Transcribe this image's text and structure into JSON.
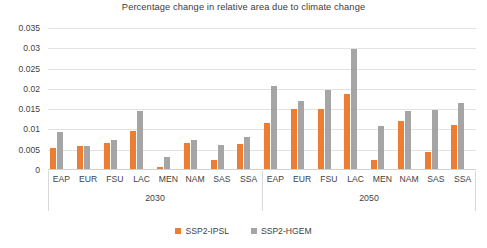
{
  "chart_data": {
    "type": "bar",
    "title": "Percentage change in relative area due to climate change",
    "xlabel": "",
    "ylabel": "",
    "ylim": [
      0,
      0.035
    ],
    "ytick_step": 0.005,
    "ytick_labels": [
      "0",
      "0.005",
      "0.01",
      "0.015",
      "0.02",
      "0.025",
      "0.03",
      "0.035"
    ],
    "ytick_values": [
      0,
      0.005,
      0.01,
      0.015,
      0.02,
      0.025,
      0.03,
      0.035
    ],
    "grid": true,
    "legend_position": "bottom",
    "categories": [
      "EAP",
      "EUR",
      "FSU",
      "LAC",
      "MEN",
      "NAM",
      "SAS",
      "SSA"
    ],
    "groups": [
      "2030",
      "2050"
    ],
    "series": [
      {
        "name": "SSP2-IPSL",
        "color": "#ED7D31",
        "values_2030": [
          0.0055,
          0.006,
          0.0067,
          0.0095,
          0.0007,
          0.0067,
          0.0024,
          0.0063
        ],
        "values_2050": [
          0.0115,
          0.015,
          0.015,
          0.0187,
          0.0025,
          0.0122,
          0.0045,
          0.0112
        ]
      },
      {
        "name": "SSP2-HGEM",
        "color": "#A5A5A5",
        "values_2030": [
          0.0093,
          0.006,
          0.0073,
          0.0146,
          0.0033,
          0.0075,
          0.0061,
          0.0082
        ],
        "values_2050": [
          0.0208,
          0.017,
          0.0198,
          0.0298,
          0.0108,
          0.0145,
          0.0148,
          0.0165
        ]
      }
    ]
  },
  "legend": {
    "items": [
      {
        "label": "SSP2-IPSL",
        "color": "#ED7D31",
        "swatch": "legend-swatch-orange"
      },
      {
        "label": "SSP2-HGEM",
        "color": "#A5A5A5",
        "swatch": "legend-swatch-gray"
      }
    ]
  }
}
